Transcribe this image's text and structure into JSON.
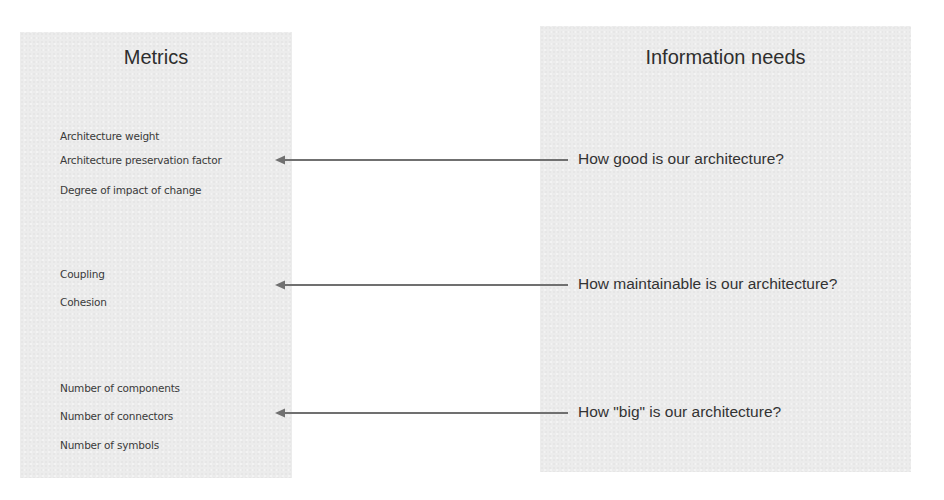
{
  "left_panel": {
    "title": "Metrics",
    "groups": [
      {
        "items": [
          "Architecture weight",
          "Architecture preservation factor",
          "Degree of impact of change"
        ]
      },
      {
        "items": [
          "Coupling",
          "Cohesion"
        ]
      },
      {
        "items": [
          "Number of components",
          "Number of connectors",
          "Number of symbols"
        ]
      }
    ]
  },
  "right_panel": {
    "title": "Information needs",
    "needs": [
      "How good is our architecture?",
      "How maintainable is our architecture?",
      "How \"big\" is our architecture?"
    ]
  },
  "arrows": [
    {
      "from": "How good is our architecture?",
      "to": "Architecture preservation factor"
    },
    {
      "from": "How maintainable is our architecture?",
      "to": "Coupling / Cohesion"
    },
    {
      "from": "How \"big\" is our architecture?",
      "to": "Number of connectors"
    }
  ],
  "colors": {
    "panel_bg": "#ececec",
    "arrow": "#707070",
    "text": "#333333"
  }
}
